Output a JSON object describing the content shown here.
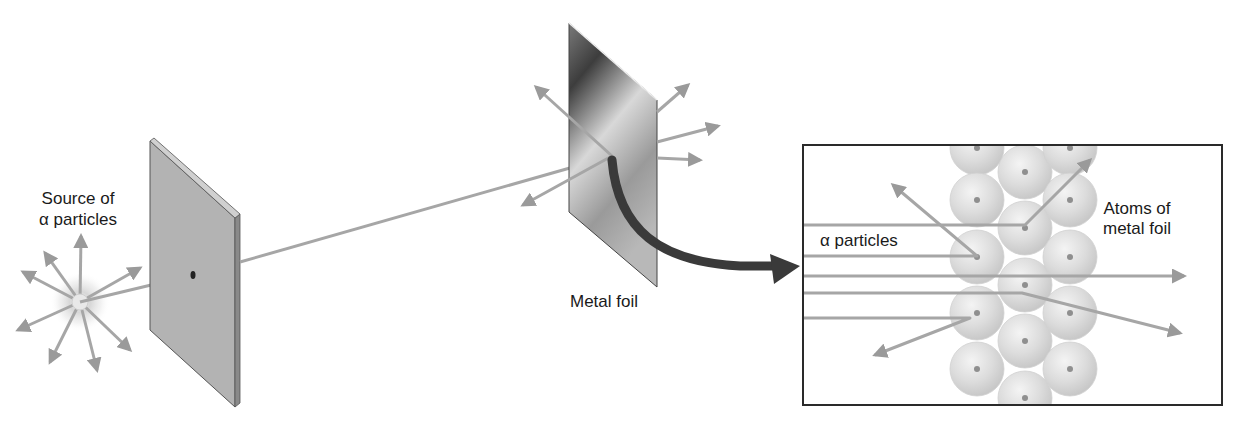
{
  "figure": {
    "colors": {
      "ray": "#a6a6a6",
      "ray_head": "#9a9a9a",
      "plate_face": "#b3b3b3",
      "plate_edge": "#7a7a7a",
      "foil_dark": "#3d3d3d",
      "foil_light": "#d8d8d8",
      "curved_arrow": "#3a3a3a",
      "atom_fill": "#dcdcdc",
      "atom_nucleus": "#8f8f8f",
      "inset_border": "#2a2a2a",
      "text": "#1a1a1a"
    }
  },
  "labels": {
    "source_line1": "Source of",
    "source_line2": "α particles",
    "metal_foil": "Metal foil",
    "inset_particles": "α particles",
    "atoms_line1": "Atoms of",
    "atoms_line2": "metal foil"
  },
  "source": {
    "center": [
      80,
      302
    ],
    "ray_tips": [
      [
        81,
        236
      ],
      [
        45,
        253
      ],
      [
        23,
        272
      ],
      [
        140,
        268
      ],
      [
        18,
        330
      ],
      [
        50,
        362
      ],
      [
        97,
        370
      ],
      [
        130,
        350
      ]
    ]
  },
  "screen": {
    "name": "lead screen with pinhole",
    "corners": [
      [
        150,
        141
      ],
      [
        235,
        218
      ],
      [
        235,
        407
      ],
      [
        150,
        330
      ]
    ],
    "pinhole": [
      193,
      275
    ]
  },
  "foil": {
    "corners": [
      [
        569,
        23
      ],
      [
        657,
        100
      ],
      [
        657,
        287
      ],
      [
        569,
        212
      ]
    ],
    "hit_point": [
      612,
      156
    ],
    "scatter_rays": [
      {
        "from": [
          612,
          156
        ],
        "to": [
          536,
          87
        ]
      },
      {
        "from": [
          612,
          156
        ],
        "to": [
          523,
          205
        ]
      },
      {
        "from": [
          657,
          112
        ],
        "to": [
          688,
          85
        ]
      },
      {
        "from": [
          657,
          142
        ],
        "to": [
          718,
          126
        ]
      },
      {
        "from": [
          657,
          158
        ],
        "to": [
          700,
          160
        ]
      }
    ]
  },
  "inset": {
    "box": [
      803,
      145,
      1222,
      405
    ],
    "atom_radius": 27,
    "atoms": [
      [
        977,
        148
      ],
      [
        977,
        200
      ],
      [
        977,
        257
      ],
      [
        977,
        313
      ],
      [
        977,
        369
      ],
      [
        1025,
        172
      ],
      [
        1025,
        228
      ],
      [
        1025,
        285
      ],
      [
        1025,
        341
      ],
      [
        1025,
        398
      ],
      [
        1070,
        148
      ],
      [
        1070,
        200
      ],
      [
        1070,
        257
      ],
      [
        1070,
        313
      ],
      [
        1070,
        369
      ]
    ],
    "rays": [
      {
        "y": 225,
        "bend": [
          1025,
          225
        ],
        "tip": [
          1090,
          160
        ],
        "outcome": "deflected"
      },
      {
        "y": 256,
        "bend": [
          977,
          256
        ],
        "tip": [
          893,
          185
        ],
        "outcome": "reflected"
      },
      {
        "y": 276,
        "bend": null,
        "tip": [
          1184,
          276
        ],
        "outcome": "passed through"
      },
      {
        "y": 293,
        "bend": [
          1022,
          293
        ],
        "tip": [
          1180,
          333
        ],
        "outcome": "deflected"
      },
      {
        "y": 318,
        "bend": [
          970,
          318
        ],
        "tip": [
          875,
          355
        ],
        "outcome": "reflected"
      }
    ]
  }
}
